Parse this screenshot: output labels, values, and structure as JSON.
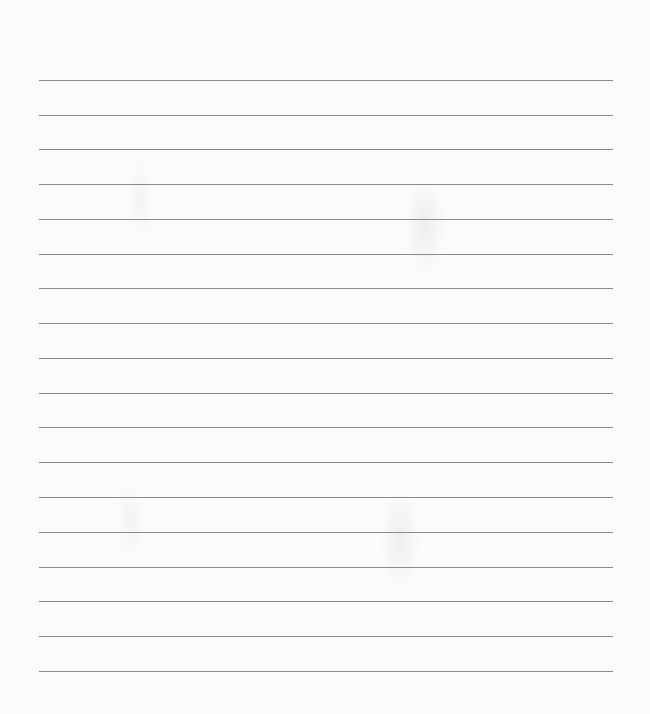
{
  "document": {
    "type": "lined-paper",
    "line_count": 18,
    "line_color": "#8a8a8a",
    "background_color": "#fbfbfb",
    "text_content": ""
  },
  "lines": [
    {
      "y": 80
    },
    {
      "y": 115
    },
    {
      "y": 149
    },
    {
      "y": 184
    },
    {
      "y": 219
    },
    {
      "y": 254
    },
    {
      "y": 288
    },
    {
      "y": 323
    },
    {
      "y": 358
    },
    {
      "y": 393
    },
    {
      "y": 427
    },
    {
      "y": 462
    },
    {
      "y": 497
    },
    {
      "y": 532
    },
    {
      "y": 567
    },
    {
      "y": 601
    },
    {
      "y": 636
    },
    {
      "y": 671
    }
  ]
}
